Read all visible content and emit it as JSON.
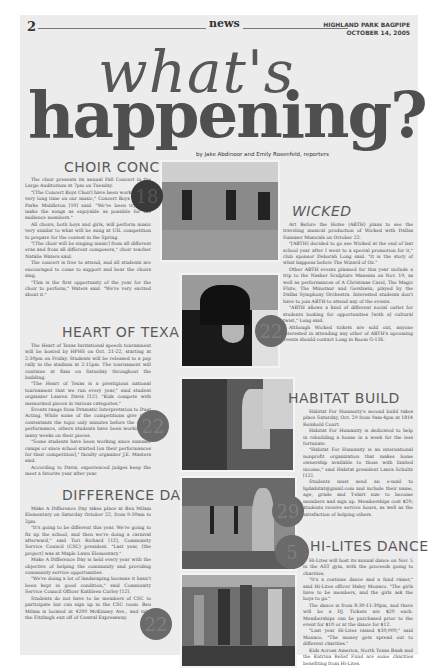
{
  "header": {
    "page_number": "2",
    "section": "news",
    "publication": "HIGHLAND PARK BAGPIPE",
    "date": "OCTOBER 14, 2005"
  },
  "headline": {
    "line1": "what's",
    "line2": "happening?",
    "byline": "by Jake Abdinoor and Emily Rosenfeld, reporters"
  },
  "stories": {
    "choir": {
      "title": "CHOIR CONCERT",
      "date_badge": "18",
      "paragraphs": [
        "The choir presents its annual Fall Concert in the Large Auditorium at 7pm on Tuesday.",
        "\"[The Concert Boys Choir] have been working for a very long time on our music,\" Concert Boys member Parke Middleton [10] said. \"We've been trying to make the songs as enjoyable as possible for the audience members.\"",
        "All choirs, both boys and girls, will perform music very similar to what will be sung at UIL competition to prepare for the contest in the Spring.",
        "\"[The choir will be singing music] from all different eras and from all different composers,\" choir teacher Natalie Waters said.",
        "The concert is free to attend, and all students are encouraged to come to support and hear the choirs sing.",
        "\"This is the first opportunity of the year for the choir to perform,\" Waters said. \"We're very excited about it.\""
      ]
    },
    "wicked": {
      "title": "WICKED",
      "date_badge": "22",
      "paragraphs": [
        "Art Before the Hotse (ABTH) plans to see the traveling musical production of Wicked with Dallas Summer Musicals on October 22.",
        "\"[ABTH] decided to go see Wicked at the end of last school year after I went to a special promotion for it,\" club sponsor Deborah Long said. \"It is the story of what happens before The Wizard of Oz.\"",
        "Other ABTH events planned for this year include a trip to the Nasher Sculpture Museum on Nov. 19, as well as performances of A Christmas Carol, The Magic Flute, The Minotaur and Gershwin, played by the Dallas Symphony Orchestra. Interested students don't have to join ABTH to attend any of the events.",
        "\"ABTH allows a kind of different social outlet for students looking for opportunities [with a] cultural twist,\" Long said.",
        "Although Wicked tickets are sold out, anyone interested in attending any other of ABTH's upcoming events should contact Long in Room G-126."
      ]
    },
    "heart_of_texas": {
      "title": "HEART OF TEXAS",
      "date_badge": "22",
      "paragraphs": [
        "The Heart of Texas Invitational speech tournament will be hosted by HPHS on Oct. 21-22, starting at 2:30pm on Friday. Students will be released to a pep rally in the stadium at 2:15pm. The tournament will continue at 8am on Saturday throughout the building.",
        "\"The Heart of Texas is a prestigious national tournament that we run every year,\" said student organizer Lauren Davis [12]. \"Kids compete with memorized pieces in various categories.\"",
        "Events range from Dramatic Interpretation to Duet Acting. While some of the competitions give their contestants the topic only minutes before the actual performance, others students have been working for many weeks on their pieces.",
        "\"Some students have been working since summer camps or since school started [on their performances for their competition],\" faculty organizer J.E. Masters said.",
        "According to Davis, experienced judges keep the meet a favorite year after year."
      ]
    },
    "habitat": {
      "title": "HABITAT BUILD",
      "date_badge": "29",
      "paragraphs": [
        "Habitat For Humanity's second build takes place Saturday, Oct. 29 from 9am-4pm at 1814 Reinhold Court.",
        "Habitat For Humanity is dedicated to help in rebuilding a house in a week for the less fortunate.",
        "\"Habitat For Humanity is an international nonprofit organization that makes home ownership available to those with limited income,\" said Habitat president Laura Schultz [12].",
        "Students must send an e-mail to hphabitat@gmail.com and include their name, age, grade and T-shirt size to become members and sign up. Memberships cost $20; students receive service hours, as well as the satisfaction of helping others."
      ]
    },
    "difference_day": {
      "title": "DIFFERENCE DAY",
      "date_badge": "22",
      "paragraphs": [
        "Make A Difference Day takes place at Ben Milam Elementary on Saturday October 22, from 9:30am to 2pm.",
        "\"It's going to be different this year. We're going to fix up the school, and then we're doing a carnival afterward,\" said Tori Richard [12], Community Service Council (CSC) president. \"Last year, [the project] was at Maple Lawn Elementary.\"",
        "Make A Difference Day is held every year with the objective of helping the community and providing community service opportunities.",
        "\"We're doing a lot of landscaping because it hasn't been kept in good condition,\" said Community Service Council Officer Kathleen Curley [12].",
        "Students do not have to be members of CSC to participate but can sign up in the CSC room. Ben Milam is located at 4200 McKinney Ave., and take the Fitzhugh exit off of Central Expressway."
      ]
    },
    "hilites": {
      "title": "HI-LITES DANCE",
      "date_badge": "5",
      "paragraphs": [
        "Hi-Lites will host its annual dance on Nov. 5 in the AST gym, with the proceeds going to charities.",
        "\"It's a costume dance and a fund raiser,\" said Hi-Lites officer Haley Monaco. \"The girls have to be members, and the girls ask the boys to go.\"",
        "The dance is from 8:30-11:30pm, and there will be a DJ. Tickets are $20 each. Memberships can be purchased prior to the event for $10 or at the dance for $12.",
        "\"Last year Hi-Lites raised $30,000,\" said Monaco. \"The money gets spread out to different charities.\"",
        "Kids Across America, North Texas Bank and the Katrina Relief Fund are some charities benefiting from Hi-Lites."
      ]
    }
  },
  "photos": [
    {
      "name": "choir-rehearsal-photo"
    },
    {
      "name": "wicked-poster-photo"
    },
    {
      "name": "speech-student-photo"
    },
    {
      "name": "habitat-construction-photo"
    },
    {
      "name": "landscaping-volunteers-photo"
    }
  ]
}
